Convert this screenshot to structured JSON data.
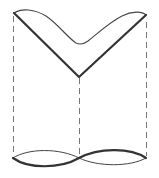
{
  "diagram": {
    "colors": {
      "background": "#ffffff",
      "stroke_dark": "#333333",
      "stroke_light": "#555555",
      "dashed": "#777777"
    },
    "labels": []
  }
}
